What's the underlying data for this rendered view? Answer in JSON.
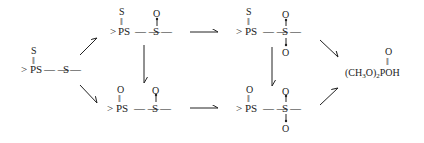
{
  "diagram": {
    "type": "reaction-scheme",
    "nodes": {
      "start": {
        "prefix": ">",
        "p_label": "P",
        "ps_label": "PS",
        "double_bond_atom": "S",
        "double_bond": "‖",
        "link": "— —",
        "s_label": "S",
        "tail": "—"
      },
      "top_sulfoxide": {
        "prefix": ">",
        "ps_label": "PS",
        "double_bond_atom": "S",
        "double_bond": "‖",
        "link": "— —",
        "s_label": "S",
        "tail": "—",
        "oxide_atom": "O"
      },
      "bottom_sulfoxide": {
        "prefix": ">",
        "ps_label": "PS",
        "double_bond_atom": "O",
        "double_bond": "‖",
        "link": "— —",
        "s_label": "S",
        "tail": "—",
        "oxide_atom": "O"
      },
      "top_sulfone": {
        "prefix": ">",
        "ps_label": "PS",
        "double_bond_atom": "S",
        "double_bond": "‖",
        "link": "— —",
        "s_label": "S",
        "tail": "—",
        "oxide_top": "O",
        "oxide_bottom": "O"
      },
      "bottom_sulfone": {
        "prefix": ">",
        "ps_label": "PS",
        "double_bond_atom": "O",
        "double_bond": "‖",
        "link": "— —",
        "s_label": "S",
        "tail": "—",
        "oxide_top": "O",
        "oxide_bottom": "O"
      },
      "product": {
        "formula_prefix": "(CH",
        "sub3": "3",
        "formula_mid": "O)",
        "sub2": "2",
        "formula_suffix": "POH",
        "double_bond_atom": "O",
        "double_bond": "‖"
      }
    },
    "edges": [
      {
        "from": "start",
        "to": "top_sulfoxide",
        "direction": "up-right"
      },
      {
        "from": "start",
        "to": "bottom_sulfoxide",
        "direction": "down-right"
      },
      {
        "from": "top_sulfoxide",
        "to": "bottom_sulfoxide",
        "direction": "down"
      },
      {
        "from": "top_sulfoxide",
        "to": "top_sulfone",
        "direction": "right"
      },
      {
        "from": "bottom_sulfoxide",
        "to": "bottom_sulfone",
        "direction": "right"
      },
      {
        "from": "top_sulfone",
        "to": "bottom_sulfone",
        "direction": "down"
      },
      {
        "from": "top_sulfone",
        "to": "product",
        "direction": "down-right"
      },
      {
        "from": "bottom_sulfone",
        "to": "product",
        "direction": "up-right"
      }
    ]
  }
}
